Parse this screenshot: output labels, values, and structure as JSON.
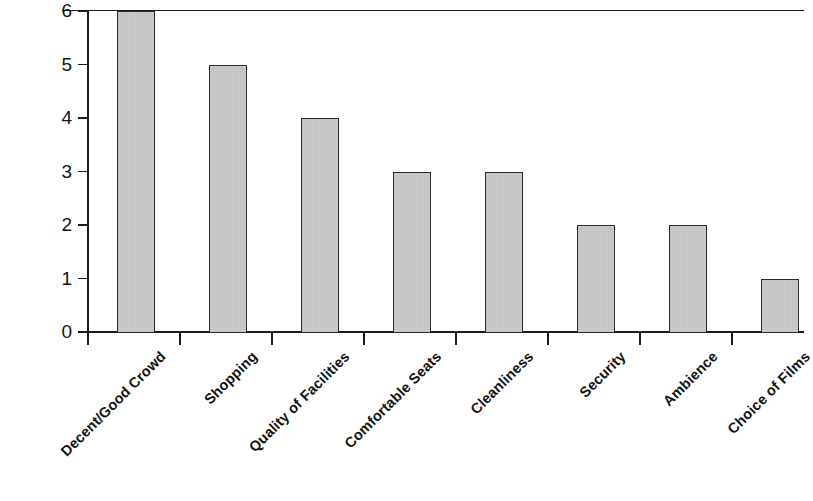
{
  "chart_data": {
    "type": "bar",
    "title": "",
    "subtitle": "",
    "xlabel": "",
    "ylabel": "",
    "categories": [
      "Decent/Good Crowd",
      "Shopping",
      "Quality of Facilities",
      "Comfortable Seats",
      "Cleanliness",
      "Security",
      "Ambience",
      "Choice of Films"
    ],
    "values": [
      6,
      5,
      4,
      3,
      3,
      2,
      2,
      1
    ],
    "ylim": [
      0,
      6
    ],
    "y_ticks": [
      "0",
      "1",
      "2",
      "3",
      "4",
      "5",
      "6"
    ],
    "y_tick_values": [
      0,
      1,
      2,
      3,
      4,
      5,
      6
    ],
    "grid": "top-border-only",
    "legend": "none",
    "bar_fill_color": "#c9c9c9",
    "bar_border_color": "#2a2a2a",
    "axis_color": "#1c1c1c",
    "background_color": "#ffffff",
    "label_rotation_degrees": -45
  }
}
